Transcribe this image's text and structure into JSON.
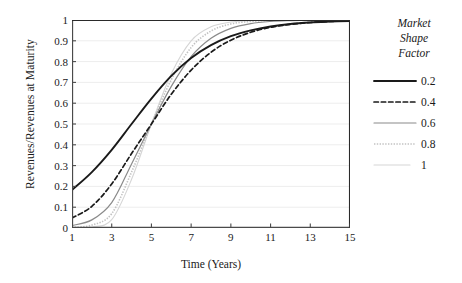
{
  "chart_data": {
    "type": "line",
    "title": "",
    "xlabel": "Time (Years)",
    "ylabel": "Revenues/Revenues at Maturity",
    "xlim": [
      1,
      15
    ],
    "ylim": [
      0,
      1
    ],
    "grid": true,
    "xticks": [
      "1",
      "3",
      "5",
      "7",
      "9",
      "11",
      "13",
      "15"
    ],
    "yticks": [
      "0",
      "0.1",
      "0.2",
      "0.3",
      "0.4",
      "0.5",
      "0.6",
      "0.7",
      "0.8",
      "0.9",
      "1"
    ],
    "legend_title": "Market Shape Factor",
    "legend_position": "right",
    "x": [
      1,
      2,
      3,
      4,
      5,
      6,
      7,
      8,
      9,
      10,
      11,
      12,
      13,
      14,
      15
    ],
    "series": [
      {
        "name": "0.2",
        "style": "solid",
        "color": "#1a1a1a",
        "width": 1.9,
        "values": [
          0.183,
          0.269,
          0.376,
          0.5,
          0.622,
          0.731,
          0.817,
          0.879,
          0.922,
          0.95,
          0.969,
          0.981,
          0.988,
          0.992,
          0.995
        ]
      },
      {
        "name": "0.4",
        "style": "dashed",
        "color": "#1a1a1a",
        "width": 1.7,
        "values": [
          0.048,
          0.104,
          0.212,
          0.358,
          0.5,
          0.643,
          0.759,
          0.845,
          0.903,
          0.941,
          0.965,
          0.979,
          0.988,
          0.993,
          0.996
        ]
      },
      {
        "name": "0.6",
        "style": "solid",
        "color": "#8a8a8a",
        "width": 1.2,
        "values": [
          0.012,
          0.039,
          0.122,
          0.308,
          0.5,
          0.681,
          0.824,
          0.912,
          0.96,
          0.983,
          0.993,
          0.997,
          0.999,
          0.999,
          1.0
        ]
      },
      {
        "name": "0.8",
        "style": "dotted",
        "color": "#c2c2c2",
        "width": 1.6,
        "values": [
          0.003,
          0.014,
          0.069,
          0.269,
          0.5,
          0.713,
          0.868,
          0.947,
          0.981,
          0.993,
          0.998,
          0.999,
          1.0,
          1.0,
          1.0
        ]
      },
      {
        "name": "1",
        "style": "solid",
        "color": "#d5d5d5",
        "width": 1.1,
        "values": [
          0.001,
          0.005,
          0.04,
          0.234,
          0.5,
          0.742,
          0.9,
          0.967,
          0.99,
          0.997,
          0.999,
          1.0,
          1.0,
          1.0,
          1.0
        ]
      }
    ]
  }
}
